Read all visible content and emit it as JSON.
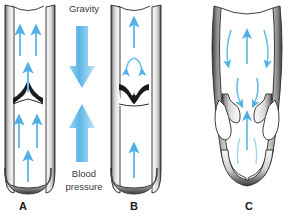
{
  "figure": {
    "panels": [
      {
        "id": "A",
        "label": "A",
        "name": "normal-vein-open-valve",
        "description": "Normal vein with competent valve held open by upward blood flow",
        "valve_state": "open",
        "vessel_state": "normal",
        "flow_direction": "upward",
        "arrow_count": 6
      },
      {
        "id": "B",
        "label": "B",
        "name": "normal-vein-closed-valve",
        "description": "Normal vein with competent valve closed, preventing backflow",
        "valve_state": "closed",
        "vessel_state": "normal",
        "flow_direction": "upward-blocked",
        "arrow_count": 4
      },
      {
        "id": "C",
        "label": "C",
        "name": "varicose-vein-incompetent-valve",
        "description": "Dilated varicose vein with incompetent valve allowing reflux",
        "valve_state": "incompetent",
        "vessel_state": "dilated",
        "flow_direction": "reflux",
        "arrow_count": 9
      }
    ],
    "annotations": {
      "gravity_label": "Gravity",
      "blood_pressure_label_line1": "Blood",
      "blood_pressure_label_line2": "pressure",
      "gravity_arrow_direction": "down",
      "blood_pressure_arrow_direction": "up"
    },
    "colors": {
      "arrow_blue": "#5BB5E8",
      "arrow_blue_light": "#A9D9F2",
      "arrow_blue_dark": "#3C9FD8",
      "vessel_outline": "#2B2B2B",
      "vessel_wall_light": "#F2F2F2",
      "vessel_wall_mid": "#BDBDBD",
      "vessel_wall_dark": "#6E6E6E",
      "lumen": "#FFFFFF",
      "text": "#1B1B1B",
      "caption_text": "#3A3A3A",
      "background": "#FFFFFF"
    }
  }
}
